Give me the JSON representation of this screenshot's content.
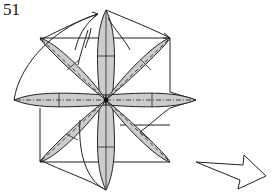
{
  "diagram": {
    "step_number": "51",
    "colors": {
      "petal_fill": "#cccccc",
      "line": "#222222",
      "background": "#ffffff"
    },
    "center": [
      106,
      100
    ],
    "petals": [
      {
        "name": "top",
        "tip": [
          106,
          10
        ]
      },
      {
        "name": "top-right",
        "tip": [
          170,
          38
        ]
      },
      {
        "name": "right",
        "tip": [
          196,
          100
        ]
      },
      {
        "name": "bottom-right",
        "tip": [
          170,
          162
        ]
      },
      {
        "name": "bottom",
        "tip": [
          106,
          190
        ]
      },
      {
        "name": "bottom-left",
        "tip": [
          40,
          162
        ]
      },
      {
        "name": "left",
        "tip": [
          14,
          100
        ]
      },
      {
        "name": "top-left",
        "tip": [
          40,
          38
        ]
      }
    ],
    "next_arrow": {
      "direction": "right",
      "style": "hollow"
    }
  }
}
